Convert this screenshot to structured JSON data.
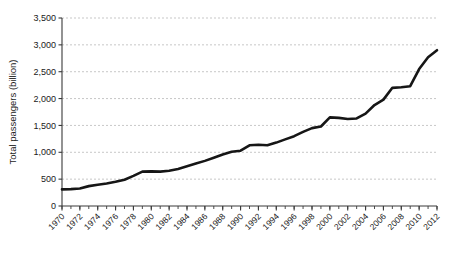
{
  "chart_data": {
    "type": "line",
    "title": "",
    "xlabel": "",
    "ylabel": "Total passengers (billion)",
    "ylim": [
      0,
      3500
    ],
    "xlim": [
      1970,
      2012
    ],
    "grid": "horizontal-dashed",
    "legend": "none",
    "y_ticks": [
      "0",
      "500",
      "1,000",
      "1,500",
      "2,000",
      "2,500",
      "3,000",
      "3,500"
    ],
    "y_tick_values": [
      0,
      500,
      1000,
      1500,
      2000,
      2500,
      3000,
      3500
    ],
    "x_ticks": [
      "1970",
      "1972",
      "1974",
      "1976",
      "1978",
      "1980",
      "1982",
      "1984",
      "1986",
      "1988",
      "1990",
      "1992",
      "1994",
      "1996",
      "1998",
      "2000",
      "2002",
      "2004",
      "2006",
      "2008",
      "2010",
      "2012"
    ],
    "x_tick_values": [
      1970,
      1972,
      1974,
      1976,
      1978,
      1980,
      1982,
      1984,
      1986,
      1988,
      1990,
      1992,
      1994,
      1996,
      1998,
      2000,
      2002,
      2004,
      2006,
      2008,
      2010,
      2012
    ],
    "x_minor_step": 1,
    "series": [
      {
        "name": "Total passengers",
        "color": "#161616",
        "x": [
          1970,
          1971,
          1972,
          1973,
          1974,
          1975,
          1976,
          1977,
          1978,
          1979,
          1980,
          1981,
          1982,
          1983,
          1984,
          1985,
          1986,
          1987,
          1988,
          1989,
          1990,
          1991,
          1992,
          1993,
          1994,
          1995,
          1996,
          1997,
          1998,
          1999,
          2000,
          2001,
          2002,
          2003,
          2004,
          2005,
          2006,
          2007,
          2008,
          2009,
          2010,
          2011,
          2012
        ],
        "values": [
          310,
          315,
          325,
          370,
          395,
          420,
          450,
          490,
          560,
          640,
          645,
          640,
          655,
          690,
          740,
          790,
          840,
          900,
          960,
          1010,
          1030,
          1130,
          1140,
          1130,
          1180,
          1240,
          1300,
          1380,
          1450,
          1480,
          1650,
          1640,
          1620,
          1630,
          1720,
          1880,
          1980,
          2200,
          2210,
          2230,
          2550,
          2770,
          2900
        ]
      }
    ]
  }
}
